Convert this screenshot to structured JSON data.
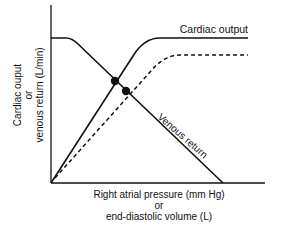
{
  "diagram": {
    "type": "line",
    "title": "",
    "ylabel_lines": [
      "Cardiac ouput",
      "or",
      "venous return (L/min)"
    ],
    "xlabel_lines": [
      "Right atrial pressure (mm Hg)",
      "or",
      "end-diastolic volume (L)"
    ],
    "curve_labels": {
      "cardiac_output": "Cardiac output",
      "venous_return": "Venous return"
    },
    "series": [
      {
        "name": "Cardiac output",
        "style": "solid"
      },
      {
        "name": "Cardiac output (shifted)",
        "style": "dashed"
      },
      {
        "name": "Venous return",
        "style": "solid"
      }
    ],
    "equilibrium_points": 2,
    "colors": {
      "line": "#111111",
      "background": "#ffffff"
    }
  }
}
